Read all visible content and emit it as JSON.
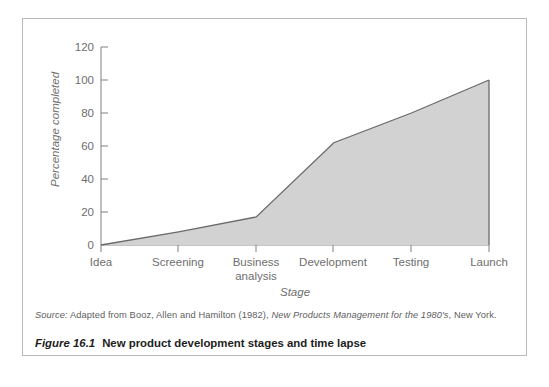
{
  "figure": {
    "source_prefix": "Source:",
    "source_text_a": " Adapted from Booz, Allen and Hamilton (1982), ",
    "source_title": "New Products Management for the 1980's",
    "source_text_b": ", New York.",
    "caption_number": "Figure 16.1",
    "caption_text": "New product development stages and time lapse"
  },
  "chart_data": {
    "type": "area",
    "title": "",
    "xlabel": "Stage",
    "ylabel": "Percentage completed",
    "categories": [
      "Idea",
      "Screening",
      "Business analysis",
      "Development",
      "Testing",
      "Launch"
    ],
    "values": [
      0,
      8,
      17,
      62,
      80,
      100
    ],
    "ylim": [
      0,
      120
    ],
    "yticks": [
      0,
      20,
      40,
      60,
      80,
      100,
      120
    ],
    "ytick_labels": [
      "0",
      "20",
      "40",
      "60",
      "80",
      "100",
      "120"
    ],
    "grid": false,
    "legend": false,
    "fill_color": "#d2d2d2",
    "line_color": "#6a6a6a",
    "axis_color": "#8a8a8a"
  }
}
